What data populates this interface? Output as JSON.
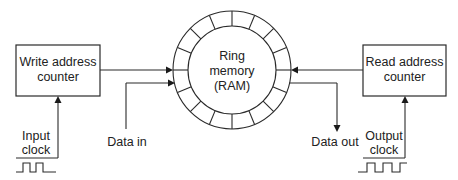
{
  "diagram": {
    "type": "block-diagram",
    "colors": {
      "line": "#2a2a2a",
      "text": "#222222",
      "background": "#ffffff"
    },
    "write_counter": {
      "line1": "Write address",
      "line2": "counter"
    },
    "read_counter": {
      "line1": "Read address",
      "line2": "counter"
    },
    "ring": {
      "line1": "Ring",
      "line2": "memory",
      "line3": "(RAM)",
      "segments": 16
    },
    "input_clock": {
      "line1": "Input",
      "line2": "clock"
    },
    "output_clock": {
      "line1": "Output",
      "line2": "clock"
    },
    "data_in": {
      "label": "Data in"
    },
    "data_out": {
      "label": "Data out"
    }
  }
}
